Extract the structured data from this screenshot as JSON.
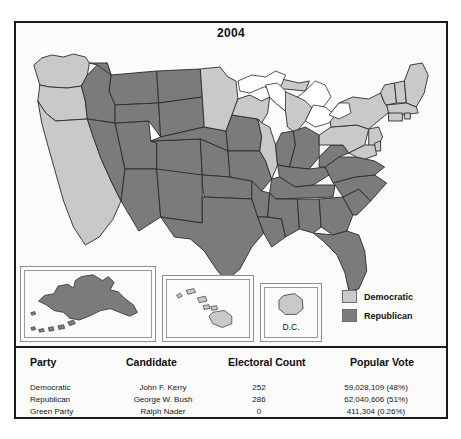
{
  "figure": {
    "title": "2004",
    "colors": {
      "democratic": "#c9c9c9",
      "republican": "#7b7b7b",
      "water": "#ffffff",
      "border": "#1b1b1b",
      "state_outline": "#2a2a2a"
    }
  },
  "legend": {
    "items": [
      {
        "label": "Democratic",
        "color": "#c9c9c9",
        "swatch": "democratic-swatch"
      },
      {
        "label": "Republican",
        "color": "#7b7b7b",
        "swatch": "republican-swatch"
      }
    ]
  },
  "insets": {
    "alaska": {
      "name": "Alaska",
      "party": "Republican",
      "color": "#7b7b7b"
    },
    "hawaii": {
      "name": "Hawaii",
      "party": "Democratic",
      "color": "#c9c9c9"
    },
    "dc": {
      "name": "D.C.",
      "label": "D.C.",
      "party": "Democratic",
      "color": "#c9c9c9"
    }
  },
  "map": {
    "states": [
      {
        "code": "WA",
        "party": "Democratic"
      },
      {
        "code": "OR",
        "party": "Democratic"
      },
      {
        "code": "CA",
        "party": "Democratic"
      },
      {
        "code": "NV",
        "party": "Republican"
      },
      {
        "code": "ID",
        "party": "Republican"
      },
      {
        "code": "MT",
        "party": "Republican"
      },
      {
        "code": "WY",
        "party": "Republican"
      },
      {
        "code": "UT",
        "party": "Republican"
      },
      {
        "code": "AZ",
        "party": "Republican"
      },
      {
        "code": "NM",
        "party": "Republican"
      },
      {
        "code": "CO",
        "party": "Republican"
      },
      {
        "code": "ND",
        "party": "Republican"
      },
      {
        "code": "SD",
        "party": "Republican"
      },
      {
        "code": "NE",
        "party": "Republican"
      },
      {
        "code": "KS",
        "party": "Republican"
      },
      {
        "code": "OK",
        "party": "Republican"
      },
      {
        "code": "TX",
        "party": "Republican"
      },
      {
        "code": "MN",
        "party": "Democratic"
      },
      {
        "code": "IA",
        "party": "Republican"
      },
      {
        "code": "MO",
        "party": "Republican"
      },
      {
        "code": "AR",
        "party": "Republican"
      },
      {
        "code": "LA",
        "party": "Republican"
      },
      {
        "code": "WI",
        "party": "Democratic"
      },
      {
        "code": "IL",
        "party": "Democratic"
      },
      {
        "code": "MI",
        "party": "Democratic"
      },
      {
        "code": "IN",
        "party": "Republican"
      },
      {
        "code": "OH",
        "party": "Republican"
      },
      {
        "code": "KY",
        "party": "Republican"
      },
      {
        "code": "TN",
        "party": "Republican"
      },
      {
        "code": "MS",
        "party": "Republican"
      },
      {
        "code": "AL",
        "party": "Republican"
      },
      {
        "code": "GA",
        "party": "Republican"
      },
      {
        "code": "FL",
        "party": "Republican"
      },
      {
        "code": "SC",
        "party": "Republican"
      },
      {
        "code": "NC",
        "party": "Republican"
      },
      {
        "code": "VA",
        "party": "Republican"
      },
      {
        "code": "WV",
        "party": "Republican"
      },
      {
        "code": "PA",
        "party": "Democratic"
      },
      {
        "code": "NY",
        "party": "Democratic"
      },
      {
        "code": "VT",
        "party": "Democratic"
      },
      {
        "code": "NH",
        "party": "Democratic"
      },
      {
        "code": "ME",
        "party": "Democratic"
      },
      {
        "code": "MA",
        "party": "Democratic"
      },
      {
        "code": "RI",
        "party": "Democratic"
      },
      {
        "code": "CT",
        "party": "Democratic"
      },
      {
        "code": "NJ",
        "party": "Democratic"
      },
      {
        "code": "DE",
        "party": "Democratic"
      },
      {
        "code": "MD",
        "party": "Democratic"
      }
    ]
  },
  "table": {
    "headers": {
      "party": "Party",
      "candidate": "Candidate",
      "electoral": "Electoral Count",
      "popular": "Popular Vote"
    },
    "rows": [
      {
        "party": "Democratic",
        "candidate": "John F. Kerry",
        "electoral": "252",
        "popular": "59,028,109 (48%)"
      },
      {
        "party": "Republican",
        "candidate": "George W. Bush",
        "electoral": "286",
        "popular": "62,040,606 (51%)"
      },
      {
        "party": "Green Party",
        "candidate": "Ralph Nader",
        "electoral": "0",
        "popular": "411,304 (0.26%)"
      }
    ]
  }
}
